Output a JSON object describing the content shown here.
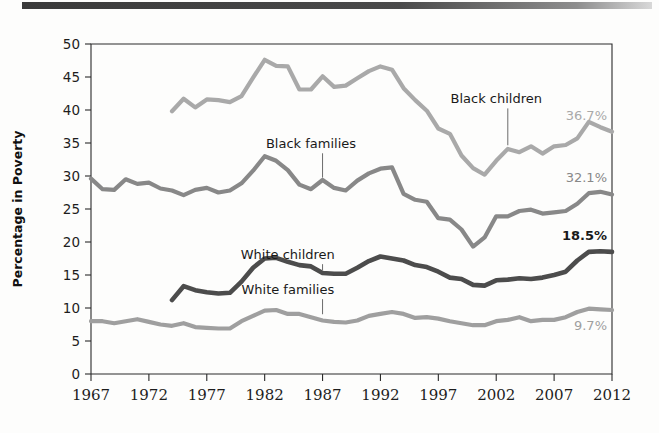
{
  "figure": {
    "top_rule_color": "#3a3a3a",
    "background": "#fdfdfc"
  },
  "chart_data": {
    "type": "line",
    "title": "",
    "xlabel": "",
    "ylabel": "Percentage in Poverty",
    "xlim": [
      1967,
      2012
    ],
    "ylim": [
      0,
      50
    ],
    "ytick_values": [
      0,
      5,
      10,
      15,
      20,
      25,
      30,
      35,
      40,
      45,
      50
    ],
    "ytick_labels": [
      "0",
      "5",
      "10",
      "15",
      "20",
      "25",
      "30",
      "35",
      "40",
      "45",
      "50"
    ],
    "xtick_values": [
      1967,
      1972,
      1977,
      1982,
      1987,
      1992,
      1997,
      2002,
      2007,
      2012
    ],
    "xtick_labels": [
      "1967",
      "1972",
      "1977",
      "1982",
      "1987",
      "1992",
      "1997",
      "2002",
      "2007",
      "2012"
    ],
    "grid": false,
    "legend": "inline-labels",
    "series": [
      {
        "name": "Black children",
        "color": "#a9a9a9",
        "width": 4.2,
        "label_x": 2002,
        "label_y": 41.0,
        "leader_to_x": 2003,
        "leader_to_y": 34.2,
        "end_label": "36.7%",
        "end_label_bold": false,
        "x": [
          1974,
          1975,
          1976,
          1977,
          1978,
          1979,
          1980,
          1981,
          1982,
          1983,
          1984,
          1985,
          1986,
          1987,
          1988,
          1989,
          1990,
          1991,
          1992,
          1993,
          1994,
          1995,
          1996,
          1997,
          1998,
          1999,
          2000,
          2001,
          2002,
          2003,
          2004,
          2005,
          2006,
          2007,
          2008,
          2009,
          2010,
          2011,
          2012
        ],
        "y": [
          39.8,
          41.7,
          40.4,
          41.6,
          41.5,
          41.2,
          42.1,
          44.9,
          47.6,
          46.7,
          46.6,
          43.1,
          43.1,
          45.1,
          43.5,
          43.7,
          44.8,
          45.9,
          46.6,
          46.1,
          43.3,
          41.5,
          39.9,
          37.2,
          36.4,
          33.1,
          31.2,
          30.2,
          32.3,
          34.1,
          33.6,
          34.5,
          33.4,
          34.5,
          34.7,
          35.7,
          38.2,
          37.4,
          36.7
        ]
      },
      {
        "name": "Black families",
        "color": "#888888",
        "width": 4.2,
        "label_x": 1986,
        "label_y": 34.2,
        "leader_to_x": 1987,
        "leader_to_y": 29.3,
        "end_label": "32.1%",
        "end_label_bold": false,
        "x": [
          1967,
          1968,
          1969,
          1970,
          1971,
          1972,
          1973,
          1974,
          1975,
          1976,
          1977,
          1978,
          1979,
          1980,
          1981,
          1982,
          1983,
          1984,
          1985,
          1986,
          1987,
          1988,
          1989,
          1990,
          1991,
          1992,
          1993,
          1994,
          1995,
          1996,
          1997,
          1998,
          1999,
          2000,
          2001,
          2002,
          2003,
          2004,
          2005,
          2006,
          2007,
          2008,
          2009,
          2010,
          2011,
          2012
        ],
        "y": [
          29.6,
          28.0,
          27.9,
          29.5,
          28.8,
          29.0,
          28.1,
          27.8,
          27.1,
          27.9,
          28.2,
          27.5,
          27.8,
          28.9,
          30.8,
          33.0,
          32.3,
          30.9,
          28.7,
          28.0,
          29.4,
          28.2,
          27.8,
          29.3,
          30.4,
          31.1,
          31.3,
          27.3,
          26.4,
          26.1,
          23.6,
          23.4,
          21.9,
          19.3,
          20.7,
          23.9,
          23.9,
          24.7,
          24.9,
          24.3,
          24.5,
          24.7,
          25.8,
          27.4,
          27.6,
          27.2
        ]
      },
      {
        "name": "White children",
        "color": "#4c4c4c",
        "width": 4.6,
        "label_x": 1984,
        "label_y": 17.4,
        "leader_to_x": 1987,
        "leader_to_y": 15.3,
        "end_label": "18.5%",
        "end_label_bold": true,
        "x": [
          1974,
          1975,
          1976,
          1977,
          1978,
          1979,
          1980,
          1981,
          1982,
          1983,
          1984,
          1985,
          1986,
          1987,
          1988,
          1989,
          1990,
          1991,
          1992,
          1993,
          1994,
          1995,
          1996,
          1997,
          1998,
          1999,
          2000,
          2001,
          2002,
          2003,
          2004,
          2005,
          2006,
          2007,
          2008,
          2009,
          2010,
          2011,
          2012
        ],
        "y": [
          11.2,
          13.3,
          12.7,
          12.4,
          12.2,
          12.3,
          14.0,
          16.1,
          17.5,
          17.6,
          17.0,
          16.5,
          16.3,
          15.3,
          15.2,
          15.2,
          16.1,
          17.1,
          17.8,
          17.5,
          17.2,
          16.5,
          16.2,
          15.5,
          14.6,
          14.4,
          13.5,
          13.4,
          14.2,
          14.3,
          14.5,
          14.4,
          14.6,
          15.0,
          15.5,
          17.2,
          18.5,
          18.6,
          18.5
        ]
      },
      {
        "name": "White families",
        "color": "#9f9f9f",
        "width": 4.2,
        "label_x": 1984,
        "label_y": 12.1,
        "leader_to_x": 1987,
        "leader_to_y": 8.6,
        "end_label": "9.7%",
        "end_label_bold": false,
        "x": [
          1967,
          1968,
          1969,
          1970,
          1971,
          1972,
          1973,
          1974,
          1975,
          1976,
          1977,
          1978,
          1979,
          1980,
          1981,
          1982,
          1983,
          1984,
          1985,
          1986,
          1987,
          1988,
          1989,
          1990,
          1991,
          1992,
          1993,
          1994,
          1995,
          1996,
          1997,
          1998,
          1999,
          2000,
          2001,
          2002,
          2003,
          2004,
          2005,
          2006,
          2007,
          2008,
          2009,
          2010,
          2011,
          2012
        ],
        "y": [
          8.0,
          8.0,
          7.7,
          8.0,
          8.3,
          7.9,
          7.5,
          7.3,
          7.7,
          7.1,
          7.0,
          6.9,
          6.9,
          8.0,
          8.8,
          9.6,
          9.7,
          9.1,
          9.1,
          8.6,
          8.1,
          7.9,
          7.8,
          8.1,
          8.8,
          9.1,
          9.4,
          9.1,
          8.5,
          8.6,
          8.4,
          8.0,
          7.7,
          7.4,
          7.4,
          8.0,
          8.2,
          8.6,
          8.0,
          8.2,
          8.2,
          8.6,
          9.4,
          9.9,
          9.8,
          9.7
        ]
      }
    ]
  }
}
